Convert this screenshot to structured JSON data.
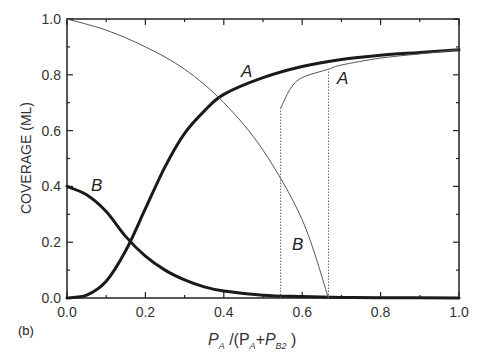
{
  "chart_data": {
    "type": "line",
    "title": "",
    "panel_label": "(b)",
    "xlabel": "P_A /(P_A+P_B2 )",
    "xlabel_parts": {
      "p1": "P",
      "s1": "A",
      "mid": " /(P",
      "s2": "A",
      "plus": "+P",
      "s3": "B2",
      "end": " )"
    },
    "ylabel": "COVERAGE  (ML)",
    "xlim": [
      0.0,
      1.0
    ],
    "ylim": [
      0.0,
      1.0
    ],
    "xticks": [
      "0.0",
      "0.2",
      "0.4",
      "0.6",
      "0.8",
      "1.0"
    ],
    "yticks": [
      "0.0",
      "0.2",
      "0.4",
      "0.6",
      "0.8",
      "1.0"
    ],
    "grid": false,
    "legend": "none (inline curve labels)",
    "curve_labels": [
      {
        "text": "A",
        "series": "A (thick)"
      },
      {
        "text": "A",
        "series": "A (thin)"
      },
      {
        "text": "B",
        "series": "B (thick)"
      },
      {
        "text": "B",
        "series": "B (thin)"
      }
    ],
    "series": [
      {
        "name": "A (thick)",
        "style": "thick solid",
        "x": [
          0.0,
          0.05,
          0.1,
          0.15,
          0.2,
          0.25,
          0.3,
          0.35,
          0.4,
          0.5,
          0.6,
          0.7,
          0.8,
          0.9,
          1.0
        ],
        "values": [
          0.0,
          0.01,
          0.06,
          0.17,
          0.32,
          0.47,
          0.59,
          0.67,
          0.73,
          0.79,
          0.83,
          0.855,
          0.87,
          0.88,
          0.89
        ]
      },
      {
        "name": "B (thick)",
        "style": "thick solid",
        "x": [
          0.0,
          0.05,
          0.1,
          0.15,
          0.2,
          0.25,
          0.3,
          0.35,
          0.4,
          0.5,
          0.6,
          0.7,
          0.8,
          1.0
        ],
        "values": [
          0.4,
          0.37,
          0.31,
          0.22,
          0.15,
          0.1,
          0.065,
          0.04,
          0.025,
          0.01,
          0.005,
          0.002,
          0.001,
          0.0
        ]
      },
      {
        "name": "B (thin)",
        "style": "thin solid",
        "x": [
          0.0,
          0.1,
          0.2,
          0.3,
          0.4,
          0.5,
          0.6,
          0.667
        ],
        "values": [
          1.0,
          0.96,
          0.9,
          0.82,
          0.7,
          0.53,
          0.28,
          0.0
        ]
      },
      {
        "name": "A (thin)",
        "style": "thin solid with dotted verticals",
        "x": [
          0.545,
          0.545,
          0.57,
          0.6,
          0.667,
          0.7,
          0.8,
          0.9,
          1.0
        ],
        "values": [
          0.0,
          0.68,
          0.75,
          0.79,
          0.82,
          0.835,
          0.86,
          0.875,
          0.89
        ]
      }
    ],
    "annotations": [
      {
        "type": "dotted-vertical",
        "x": 0.545,
        "y_range": [
          0.0,
          0.68
        ]
      },
      {
        "type": "dotted-vertical",
        "x": 0.667,
        "y_range": [
          0.0,
          0.82
        ]
      }
    ]
  }
}
